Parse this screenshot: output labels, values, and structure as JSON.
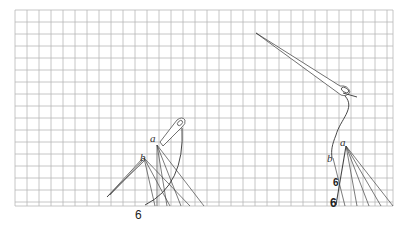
{
  "diagram": {
    "type": "embroidery-stitch-instructions",
    "grid": {
      "x0": 15,
      "y0": 10,
      "x1": 393,
      "y1": 206,
      "cell": 12,
      "color": "#b8b8b8"
    },
    "figures": [
      {
        "id": "left",
        "labels": {
          "a": "a",
          "b": "b",
          "num": "6"
        },
        "label_pos": {
          "a": [
            150,
            142
          ],
          "b": [
            140,
            161
          ],
          "num": [
            135,
            219
          ]
        },
        "point_a": [
          157,
          145
        ],
        "point_b": [
          144,
          158
        ],
        "fan_from_a": [
          [
            157,
            206
          ],
          [
            167,
            206
          ],
          [
            181,
            206
          ],
          [
            204,
            206
          ]
        ],
        "fan_from_b": [
          [
            155,
            206
          ],
          [
            170,
            206
          ],
          [
            190,
            206
          ]
        ],
        "thread_path": "M 145 205 Q 185 185 182 128",
        "needle_top": {
          "eye": [
            179,
            121
          ],
          "tail": [
            160,
            143
          ]
        },
        "needle_bottom": {
          "eye": [
            144,
            158
          ],
          "tip": [
            107,
            197
          ]
        }
      },
      {
        "id": "right",
        "labels": {
          "a": "a",
          "b": "b",
          "num": "6",
          "mid": "6"
        },
        "label_pos": {
          "a": [
            340,
            146
          ],
          "b": [
            327,
            162
          ],
          "num": [
            330,
            206
          ],
          "mid": [
            333,
            186
          ]
        },
        "point_a": [
          346,
          146
        ],
        "point_b": [
          333,
          158
        ],
        "fan_from_a": [
          [
            357,
            206
          ],
          [
            369,
            206
          ],
          [
            381,
            206
          ],
          [
            393,
            206
          ]
        ],
        "fan_from_b": [
          [
            345,
            206
          ]
        ],
        "stitch_a_to_num": [
          [
            346,
            146
          ],
          [
            336,
            205
          ]
        ],
        "thread_path": "M 345 96 C 356 108 340 120 336 135 C 332 145 331 150 332 158",
        "needle": {
          "tip": [
            256,
            33
          ],
          "eye": [
            347,
            90
          ]
        }
      }
    ]
  }
}
